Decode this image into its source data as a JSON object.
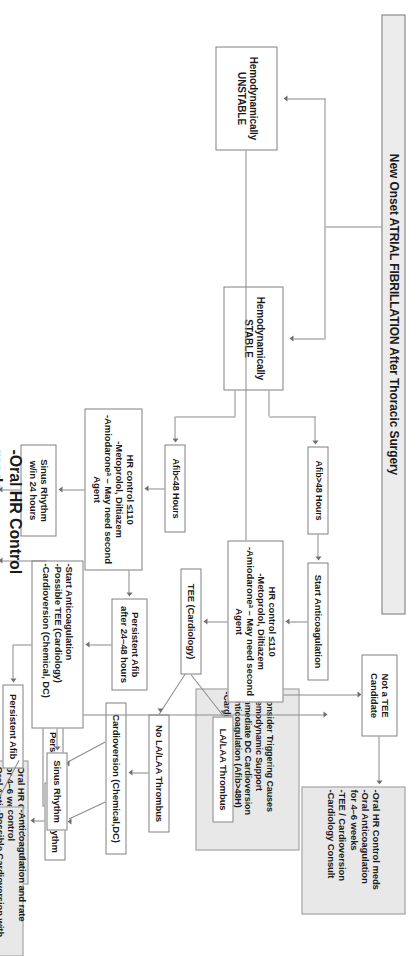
{
  "diagram": {
    "type": "flowchart",
    "orientation": "rotated-90-clockwise",
    "title": "New Onset ATRIAL FIBRILLATION After Thoracic Surgery",
    "colors": {
      "node_fill": "#ffffff",
      "node_fill_shaded": "#e8e8e8",
      "node_border": "#808080",
      "connector": "#8a8a8a",
      "text": "#1a1a1a"
    },
    "nodes": {
      "title": "New Onset ATRIAL FIBRILLATION After Thoracic Surgery",
      "hemo_stable": "Hemodynamically\nSTABLE",
      "hemo_unstable": "Hemodynamically\nUNSTABLE",
      "afib_gt48": "Afib>48 Hours",
      "afib_lt48": "Afib<48 Hours",
      "start_anticoag": "Start Anticoagulation",
      "hr_control_top": "HR control ≤110\n-Metoprolol, Diltiazem\n-Amiodaroneᵃ – May need second Agent",
      "hr_control_bottom": "HR control ≤110\n-Metoprolol, Diltiazem\n-Amiodaroneᵃ – May need second Agent",
      "tee_cardiology": "TEE (Cardiology)",
      "not_tee_candidate": "Not a TEE\nCandidate",
      "la_laa_thrombus": "LA/LAA Thrombus",
      "no_la_laa_thrombus": "No LA/LAA Thrombus",
      "cardioversion_chem_dc": "Cardioversion (Chemical,DC)",
      "persistent_afib_right": "Persistent Afib",
      "sinus_rhythm_right": "Sinus Rhythm",
      "outcome_tee_pathway": "-Oral HR Control meds\n-Oral Anticoagulation\nfor 4–6 weeks\n-TEE / Cardioversion\n-Cardiology Consult",
      "outcome_sinus_right": "-Oral HR Control meds\nfor 4–6 weeks\n-Oral Anticoagulation\nfor 4–6 weeks",
      "persistent_afib_24_48": "Persistent Afib\nafter 24–48 hours",
      "sinus_rhythm_24h": "Sinus Rhythm\nw/in 24 hours",
      "start_anticoag_tee_cv": "-Start Anticoagulation\n-Possible TEE (Cardiology)\n-Cardioversion (Chemical, DC)",
      "sinus_rhythm_mid": "Sinus Rhythm",
      "persistent_afib_mid": "Persistent Afib",
      "outcome_persistent_mid": "-Anticoagulation and rate control\n-Possible Cardioversion with TEE in\n4–6 weeks",
      "outcome_sinus_bottom": "-Oral HR Control meds –\n4–6 weeks\n-Anticoagulation for High\nRisk Patients",
      "unstable_actions": "-Consider Triggering Causes\n-Hemodynamic Support\n-Immediate DC Cardioversion\n-Anticoagulation (Afib>48H)\n-Cardiology Consult"
    }
  }
}
